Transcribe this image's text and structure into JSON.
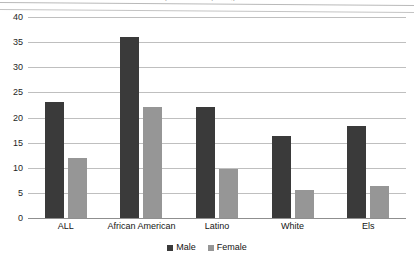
{
  "chart_data": {
    "type": "bar",
    "title": "",
    "title_sliver": "by race/ethnicity and gender",
    "xlabel": "",
    "ylabel": "",
    "categories": [
      "ALL",
      "African American",
      "Latino",
      "White",
      "Els"
    ],
    "series": [
      {
        "name": "Male",
        "color": "#3a3a3a",
        "values": [
          23,
          36,
          22,
          16.3,
          18.3
        ]
      },
      {
        "name": "Female",
        "color": "#969696",
        "values": [
          12,
          22,
          9.7,
          5.5,
          6.4
        ]
      }
    ],
    "ylim": [
      0,
      40
    ],
    "yticks": [
      0,
      5,
      10,
      15,
      20,
      25,
      30,
      35,
      40
    ],
    "ytick_labels": [
      "0",
      "5",
      "10",
      "15",
      "20",
      "25",
      "30",
      "35",
      "40"
    ],
    "grid": true,
    "legend_position": "bottom-center"
  },
  "colors": {
    "male": "#3a3a3a",
    "female": "#969696",
    "gridline": "#bfbfbf",
    "axis": "#8f8f8f",
    "background": "#ffffff"
  }
}
